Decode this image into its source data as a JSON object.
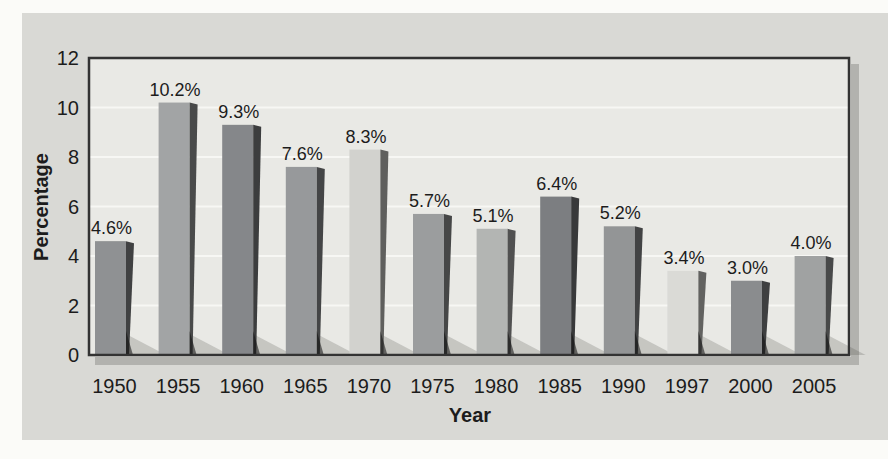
{
  "page": {
    "background_color": "#fbfbf8",
    "panel_color": "#d9d9d5",
    "plot_background_color": "#e9e9e5",
    "frame_color": "#333333",
    "frame_shadow_color": "#b2b2ae",
    "gridline_color": "#f7f7f4",
    "text_color": "#1c1c1c"
  },
  "chart_data": {
    "type": "bar",
    "title": "",
    "xlabel": "Year",
    "ylabel": "Percentage",
    "categories": [
      "1950",
      "1955",
      "1960",
      "1965",
      "1970",
      "1975",
      "1980",
      "1985",
      "1990",
      "1997",
      "2000",
      "2005"
    ],
    "values": [
      4.6,
      10.2,
      9.3,
      7.6,
      8.3,
      5.7,
      5.1,
      6.4,
      5.2,
      3.4,
      3.0,
      4.0
    ],
    "value_labels": [
      "4.6%",
      "10.2%",
      "9.3%",
      "7.6%",
      "8.3%",
      "5.7%",
      "5.1%",
      "6.4%",
      "5.2%",
      "3.4%",
      "3.0%",
      "4.0%"
    ],
    "bar_colors": [
      "#8f9193",
      "#a2a4a5",
      "#85878a",
      "#97999b",
      "#d2d2ce",
      "#9b9d9e",
      "#b3b5b3",
      "#7c7e81",
      "#939596",
      "#dadad6",
      "#8a8c8e",
      "#a0a2a2"
    ],
    "bar_side_shade_factor": 0.45,
    "floor_shadow_color": "rgba(75,75,68,0.22)",
    "yticks": [
      0,
      2,
      4,
      6,
      8,
      10,
      12
    ],
    "ylim": [
      0,
      12
    ],
    "grid": "horizontal",
    "legend": "none"
  }
}
